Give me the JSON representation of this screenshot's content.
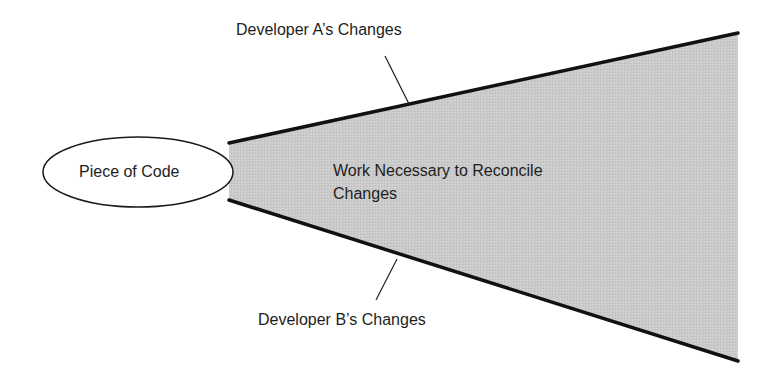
{
  "diagram": {
    "source_node": {
      "label": "Piece of Code"
    },
    "divergence_area": {
      "line1": "Work Necessary to Reconcile",
      "line2": "Changes",
      "fill_color": "#c8c8c8"
    },
    "upper_edge": {
      "label": "Developer A’s Changes"
    },
    "lower_edge": {
      "label": "Developer B’s Changes"
    },
    "edge_color": "#111111"
  }
}
